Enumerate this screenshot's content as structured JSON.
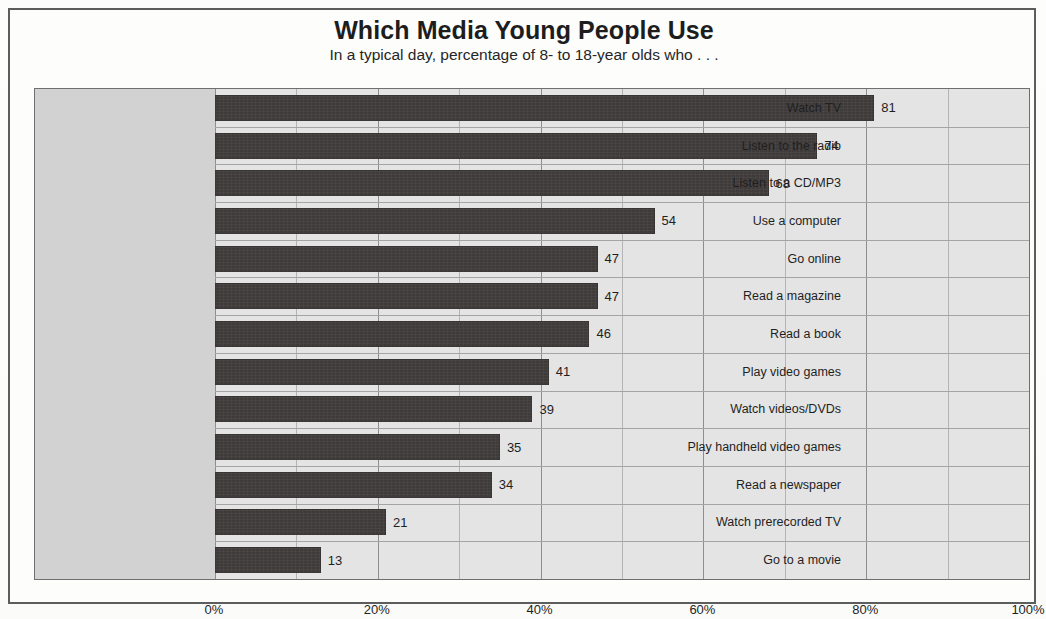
{
  "chart_title": "Which Media Young People Use",
  "chart_subtitle": "In a typical day, percentage of 8- to 18-year olds who . . .",
  "colors": {
    "bar": "#403b3b",
    "plot_background": "#e4e4e4",
    "label_band": "#d2d2d2",
    "border": "#5d5d5d",
    "gridline_major": "#8e8e8e",
    "gridline_minor": "#b4b4b4"
  },
  "axis": {
    "tick_labels": [
      "0%",
      "20%",
      "40%",
      "60%",
      "80%",
      "100%"
    ],
    "tick_values": [
      0,
      20,
      40,
      60,
      80,
      100
    ],
    "minor_step": 10
  },
  "chart_data": {
    "type": "bar",
    "orientation": "horizontal",
    "title": "Which Media Young People Use",
    "subtitle": "In a typical day, percentage of 8- to 18-year olds who . . .",
    "xlabel": "",
    "ylabel": "",
    "xlim": [
      0,
      100
    ],
    "grid": true,
    "legend": false,
    "value_labels": true,
    "categories": [
      "Watch TV",
      "Listen to the radio",
      "Listen to a CD/MP3",
      "Use a computer",
      "Go online",
      "Read a magazine",
      "Read a book",
      "Play video games",
      "Watch videos/DVDs",
      "Play handheld video games",
      "Read a newspaper",
      "Watch prerecorded TV",
      "Go to a movie"
    ],
    "values": [
      81,
      74,
      68,
      54,
      47,
      47,
      46,
      41,
      39,
      35,
      34,
      21,
      13
    ]
  }
}
